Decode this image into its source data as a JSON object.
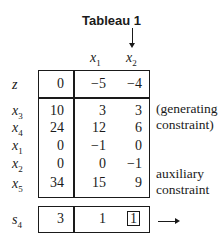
{
  "title": "Tableau 1",
  "column_headers": [
    {
      "var": "x",
      "sub": "1"
    },
    {
      "var": "x",
      "sub": "2"
    }
  ],
  "rows": [
    {
      "label": "z",
      "sub": "",
      "values": [
        "0",
        "−5",
        "−4"
      ]
    },
    {
      "label": "x",
      "sub": "3",
      "values": [
        "10",
        "3",
        "3"
      ]
    },
    {
      "label": "x",
      "sub": "4",
      "values": [
        "24",
        "12",
        "6"
      ]
    },
    {
      "label": "x",
      "sub": "1",
      "values": [
        "0",
        "−1",
        "0"
      ]
    },
    {
      "label": "x",
      "sub": "2",
      "values": [
        "0",
        "0",
        "−1"
      ]
    },
    {
      "label": "x",
      "sub": "5",
      "values": [
        "34",
        "15",
        "9"
      ]
    }
  ],
  "cut_row": {
    "label": "s",
    "sub": "4",
    "values": [
      "3",
      "1",
      "1"
    ],
    "pivot_index": 2
  },
  "notes": {
    "generating_line1": "(generating",
    "generating_line2": "constraint)",
    "auxiliary_line1": "auxiliary",
    "auxiliary_line2": "constraint"
  }
}
